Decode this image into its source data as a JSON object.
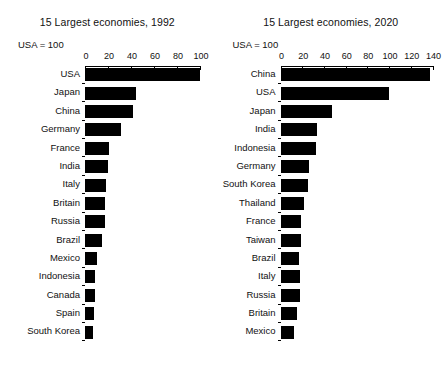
{
  "chart_data": [
    {
      "type": "bar",
      "orientation": "horizontal",
      "title": "15 Largest economies, 1992",
      "annotation": "USA = 100",
      "xlabel": "",
      "ylabel": "",
      "xlim": [
        0,
        100
      ],
      "xticks": [
        0,
        20,
        40,
        60,
        80,
        100
      ],
      "grid": false,
      "legend": false,
      "categories": [
        "USA",
        "Japan",
        "China",
        "Germany",
        "France",
        "India",
        "Italy",
        "Britain",
        "Russia",
        "Brazil",
        "Mexico",
        "Indonesia",
        "Canada",
        "Spain",
        "South Korea"
      ],
      "values": [
        100,
        44,
        42,
        31,
        21,
        20,
        18,
        17,
        17,
        15,
        10,
        9,
        9,
        8,
        7
      ]
    },
    {
      "type": "bar",
      "orientation": "horizontal",
      "title": "15 Largest economies, 2020",
      "annotation": "USA = 100",
      "xlabel": "",
      "ylabel": "",
      "xlim": [
        0,
        140
      ],
      "xticks": [
        0,
        20,
        40,
        60,
        80,
        100,
        120,
        140
      ],
      "grid": false,
      "legend": false,
      "categories": [
        "China",
        "USA",
        "Japan",
        "India",
        "Indonesia",
        "Germany",
        "South Korea",
        "Thailand",
        "France",
        "Taiwan",
        "Brazil",
        "Italy",
        "Russia",
        "Britain",
        "Mexico"
      ],
      "values": [
        138,
        100,
        47,
        34,
        33,
        26,
        25,
        22,
        19,
        19,
        17,
        18,
        18,
        15,
        12
      ]
    }
  ]
}
